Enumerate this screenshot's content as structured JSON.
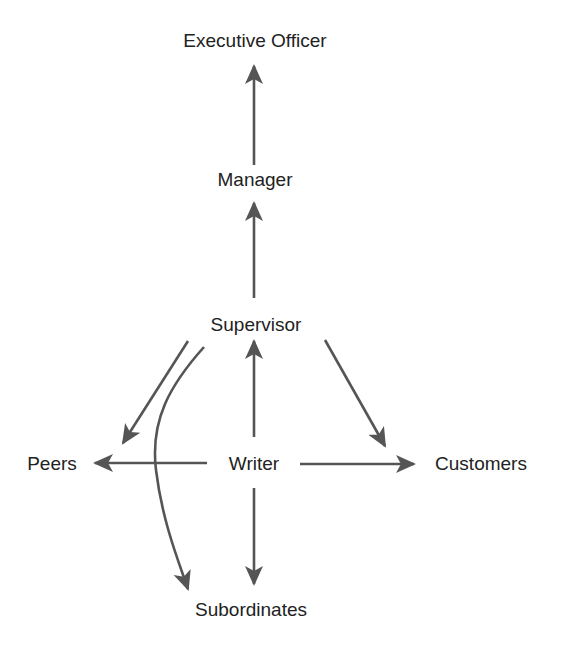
{
  "diagram": {
    "type": "communication-flow",
    "colors": {
      "text": "#222222",
      "arrow": "#555555",
      "background": "#ffffff"
    },
    "nodes": {
      "executive_officer": {
        "label": "Executive Officer",
        "x": 255,
        "y": 31
      },
      "manager": {
        "label": "Manager",
        "x": 255,
        "y": 170
      },
      "supervisor": {
        "label": "Supervisor",
        "x": 256,
        "y": 315
      },
      "writer": {
        "label": "Writer",
        "x": 254,
        "y": 454
      },
      "peers": {
        "label": "Peers",
        "x": 52,
        "y": 454
      },
      "customers": {
        "label": "Customers",
        "x": 481,
        "y": 454
      },
      "subordinates": {
        "label": "Subordinates",
        "x": 251,
        "y": 600
      }
    },
    "edges": [
      {
        "from": "Manager",
        "to": "Executive Officer",
        "shape": "straight"
      },
      {
        "from": "Supervisor",
        "to": "Manager",
        "shape": "straight"
      },
      {
        "from": "Writer",
        "to": "Supervisor",
        "shape": "straight"
      },
      {
        "from": "Writer",
        "to": "Peers",
        "shape": "straight"
      },
      {
        "from": "Writer",
        "to": "Customers",
        "shape": "straight"
      },
      {
        "from": "Writer",
        "to": "Subordinates",
        "shape": "straight"
      },
      {
        "from": "Supervisor",
        "to": "Peers",
        "shape": "straight-diagonal"
      },
      {
        "from": "Supervisor",
        "to": "Customers",
        "shape": "straight-diagonal"
      },
      {
        "from": "Supervisor",
        "to": "Subordinates",
        "shape": "curved"
      }
    ]
  }
}
